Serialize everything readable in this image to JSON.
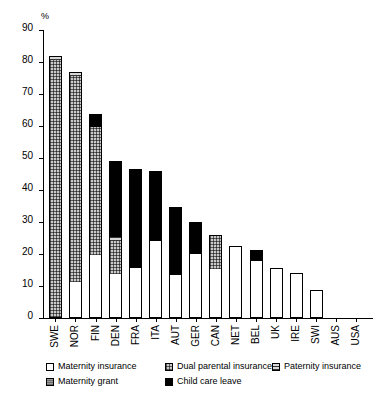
{
  "chart_data": {
    "type": "bar",
    "stacked": true,
    "title": "",
    "subtitle": "",
    "xlabel": "",
    "ylabel": "%",
    "ylim": [
      0,
      90
    ],
    "ytick_step": 10,
    "yticks": [
      0,
      10,
      20,
      30,
      40,
      50,
      60,
      70,
      80,
      90
    ],
    "ytick_labels": [
      "0",
      "10",
      "20",
      "30",
      "40",
      "50",
      "60",
      "70",
      "80",
      "90"
    ],
    "grid": false,
    "legend_position": "bottom",
    "categories": [
      "SWE",
      "NOR",
      "FIN",
      "DEN",
      "FRA",
      "ITA",
      "AUT",
      "GER",
      "CAN",
      "NET",
      "BEL",
      "UK",
      "IRE",
      "SWI",
      "AUS",
      "USA"
    ],
    "series": [
      {
        "name": "Maternity insurance",
        "key": "maternity-insurance",
        "fill": "white",
        "values": [
          0,
          11.2,
          19.6,
          13.6,
          15.7,
          24.2,
          13.3,
          20.1,
          15.2,
          22.6,
          17.7,
          15.7,
          14.0,
          8.8,
          0,
          0
        ]
      },
      {
        "name": "Maternity grant",
        "key": "maternity-grant",
        "fill": "gray-solid",
        "values": [
          0,
          0,
          0,
          0,
          0,
          0,
          0,
          0,
          0,
          0,
          0,
          0,
          0,
          0,
          0,
          0
        ]
      },
      {
        "name": "Dual parental insurance",
        "key": "dual-parental-insurance",
        "fill": "crosshatch",
        "values": [
          80.5,
          64.5,
          40.0,
          10.6,
          0,
          0,
          0,
          0,
          10.8,
          0,
          0,
          0,
          0,
          0,
          0,
          0
        ]
      },
      {
        "name": "Paternity insurance",
        "key": "paternity-insurance",
        "fill": "horizontal-lines",
        "values": [
          1.4,
          1.2,
          0,
          1.1,
          0,
          0,
          0,
          0,
          0,
          0,
          0,
          0,
          0,
          0,
          0,
          0
        ]
      },
      {
        "name": "Child care leave",
        "key": "child-care-leave",
        "fill": "black",
        "values": [
          0,
          0,
          4.1,
          23.8,
          30.8,
          21.6,
          21.3,
          9.8,
          0,
          0,
          3.5,
          0,
          0,
          0,
          0,
          0
        ]
      }
    ],
    "totals": [
      81.9,
      76.9,
      63.7,
      49.1,
      46.5,
      45.8,
      34.6,
      29.9,
      26.0,
      22.6,
      21.2,
      15.7,
      14.0,
      8.8,
      0,
      0
    ],
    "segment_order_bottom_to_top": [
      "Maternity insurance",
      "Dual parental insurance",
      "Paternity insurance",
      "Maternity grant",
      "Child care leave"
    ]
  },
  "legend": {
    "row1": [
      {
        "label": "Maternity insurance",
        "swatch": "maternity-insurance"
      },
      {
        "label": "Dual parental insurance",
        "swatch": "dual-parental-insurance"
      },
      {
        "label": "Paternity insurance",
        "swatch": "paternity-insurance"
      }
    ],
    "row2": [
      {
        "label": "Maternity grant",
        "swatch": "maternity-grant"
      },
      {
        "label": "Child care leave",
        "swatch": "child-care-leave"
      }
    ]
  },
  "colors": {
    "axis": "#000000",
    "child_care_leave": "#000000",
    "maternity_grant": "#9a9a9a",
    "dual_parental_insurance": "#c9c9c9",
    "paternity_insurance": "#d8d8d8",
    "maternity_insurance": "#ffffff",
    "background": "#ffffff"
  }
}
